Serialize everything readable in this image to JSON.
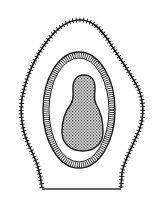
{
  "diagram": {
    "type": "biological-cross-section",
    "labels": [],
    "colors": {
      "background": "#ffffff",
      "ink": "#1a1a1a",
      "nucleus_fill": "#9a9a9a"
    },
    "structures": [
      {
        "id": "outer-wall",
        "description": "outer envelope with hairy/spiky fringe, flat base"
      },
      {
        "id": "striated-ring",
        "description": "oval layer with radial striations"
      },
      {
        "id": "inner-body",
        "description": "stippled gourd-shaped central body"
      }
    ]
  }
}
